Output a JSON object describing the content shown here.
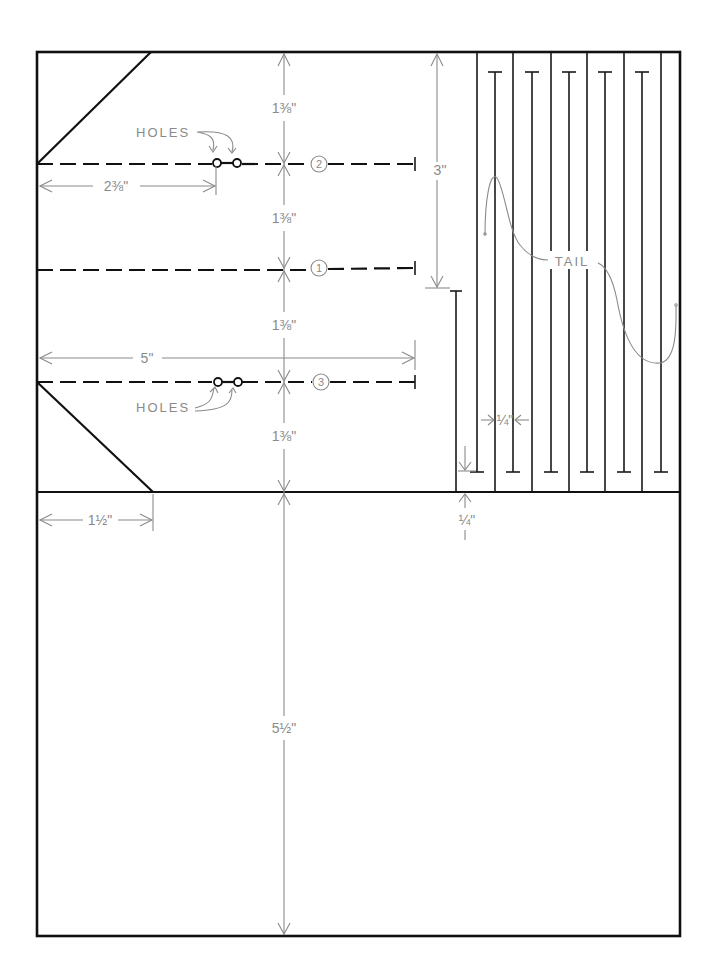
{
  "diagram": {
    "fold_lines": [
      {
        "id": "2",
        "label": "2",
        "has_holes": true
      },
      {
        "id": "1",
        "label": "1",
        "has_holes": false
      },
      {
        "id": "3",
        "label": "3",
        "has_holes": true
      }
    ],
    "labels": {
      "holes_top": "HOLES",
      "holes_bottom": "HOLES",
      "tail": "TAIL"
    },
    "dimensions": {
      "fold_spacing_1": "1⅜\"",
      "fold_spacing_2": "1⅜\"",
      "fold_spacing_3": "1⅜\"",
      "fold_spacing_4": "1⅜\"",
      "hole_offset": "2⅜\"",
      "fold_length": "5\"",
      "corner_cut": "1½\"",
      "tail_slit_length": "3\"",
      "strip_width": "¼\"",
      "slit_margin": "¼\"",
      "bottom_panel": "5½\""
    },
    "strips": {
      "count": 12,
      "tail_curves": 2
    }
  }
}
